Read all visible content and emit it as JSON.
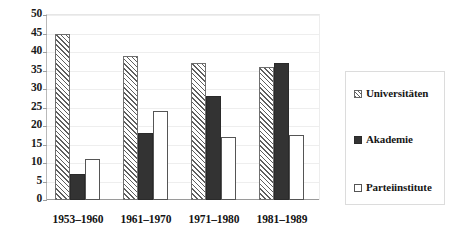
{
  "chart_data": {
    "type": "bar",
    "title": "",
    "subtitle": "",
    "xlabel": "",
    "ylabel": "",
    "categories": [
      "1953–1960",
      "1961–1970",
      "1971–1980",
      "1981–1989"
    ],
    "series": [
      {
        "name": "Universitäten",
        "values": [
          45,
          39,
          37,
          36
        ],
        "fill": "diagonal-hatch",
        "color": "#5e5e5e"
      },
      {
        "name": "Akademie",
        "values": [
          7,
          18,
          28,
          37
        ],
        "fill": "solid",
        "color": "#333333"
      },
      {
        "name": "Parteiinstitute",
        "values": [
          11,
          24,
          17,
          17.5
        ],
        "fill": "empty",
        "color": "#ffffff"
      }
    ],
    "ylim": [
      0,
      50
    ],
    "ytick_step": 5,
    "yticks": [
      "50",
      "45",
      "40",
      "35",
      "30",
      "25",
      "20",
      "15",
      "10",
      "5",
      "0"
    ],
    "ytick_values": [
      50,
      45,
      40,
      35,
      30,
      25,
      20,
      15,
      10,
      5,
      0
    ],
    "grid": true,
    "grid_axis": "y",
    "legend_position": "right",
    "legend": [
      "Universitäten",
      "Akademie",
      "Parteiinstitute"
    ]
  },
  "legend": {
    "items": [
      {
        "label": "Universitäten"
      },
      {
        "label": "Akademie"
      },
      {
        "label": "Parteiinstitute"
      }
    ]
  }
}
